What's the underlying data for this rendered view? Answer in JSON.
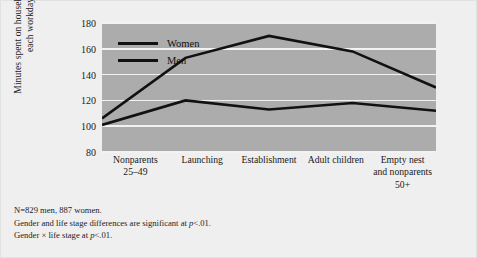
{
  "chart_data": {
    "type": "line",
    "title": "",
    "xlabel": "",
    "ylabel": "Minutes spent on household chores each workday",
    "categories": [
      "Nonparents\n25–49",
      "Launching",
      "Establishment",
      "Adult children",
      "Empty nest\nand nonparents\n50+"
    ],
    "category_lines": [
      [
        "Nonparents",
        "25–49"
      ],
      [
        "Launching"
      ],
      [
        "Establishment"
      ],
      [
        "Adult children"
      ],
      [
        "Empty nest",
        "and nonparents",
        "50+"
      ]
    ],
    "series": [
      {
        "name": "Women",
        "values": [
          106,
          153,
          170,
          158,
          130
        ],
        "color": "#111111"
      },
      {
        "name": "Men",
        "values": [
          101,
          120,
          113,
          118,
          112
        ],
        "color": "#111111"
      }
    ],
    "ylim": [
      80,
      180
    ],
    "yticks": [
      80,
      100,
      120,
      140,
      160,
      180
    ],
    "ytick_labels": [
      "80",
      "100",
      "120",
      "140",
      "160",
      "180"
    ],
    "grid": true,
    "legend_position": "top-left",
    "plot_background": "#acacac",
    "figure_background": "#efefef",
    "gridline_color": "#f2f2f2"
  },
  "legend": {
    "entries": [
      {
        "label": "Women"
      },
      {
        "label": "Men"
      }
    ]
  },
  "notes": {
    "line1_prefix": "N=829 men, 887 women.",
    "line2_prefix": "Gender and life stage differences are significant at ",
    "line2_italic": "p",
    "line2_suffix": "<.01.",
    "line3_prefix": "Gender × life stage at ",
    "line3_italic": "p",
    "line3_suffix": "<.01."
  }
}
